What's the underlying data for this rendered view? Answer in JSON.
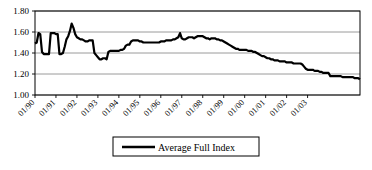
{
  "chart_data": {
    "type": "line",
    "title": "",
    "xlabel": "",
    "ylabel": "",
    "ylim": [
      1.0,
      1.8
    ],
    "ytick_values": [
      1.0,
      1.2,
      1.4,
      1.6,
      1.8
    ],
    "ytick_labels": [
      "1.00",
      "1.20",
      "1.40",
      "1.60",
      "1.80"
    ],
    "grid": true,
    "grid_axis": "y",
    "legend_position": "bottom",
    "xtick_labels": [
      "01/90",
      "01/91",
      "01/92",
      "01/93",
      "01/94",
      "01/95",
      "01/96",
      "01/97",
      "01/98",
      "01/99",
      "01/00",
      "01/01",
      "01/02",
      "01/03"
    ],
    "xtick_rotation": 45,
    "x_start": "01/90",
    "x_end": "07/03",
    "x_interval": "monthly",
    "series": [
      {
        "name": "Average Full Index",
        "color": "#000000",
        "line_width": 2.2,
        "values": [
          1.49,
          1.5,
          1.59,
          1.58,
          1.41,
          1.39,
          1.39,
          1.39,
          1.39,
          1.59,
          1.59,
          1.59,
          1.58,
          1.58,
          1.39,
          1.39,
          1.4,
          1.46,
          1.53,
          1.56,
          1.61,
          1.68,
          1.64,
          1.58,
          1.55,
          1.54,
          1.53,
          1.53,
          1.52,
          1.51,
          1.51,
          1.52,
          1.52,
          1.52,
          1.4,
          1.38,
          1.36,
          1.34,
          1.34,
          1.35,
          1.35,
          1.34,
          1.41,
          1.42,
          1.42,
          1.42,
          1.42,
          1.42,
          1.42,
          1.43,
          1.43,
          1.44,
          1.47,
          1.48,
          1.48,
          1.51,
          1.52,
          1.52,
          1.52,
          1.52,
          1.51,
          1.51,
          1.5,
          1.5,
          1.5,
          1.5,
          1.5,
          1.5,
          1.5,
          1.5,
          1.5,
          1.5,
          1.51,
          1.51,
          1.51,
          1.52,
          1.52,
          1.52,
          1.52,
          1.53,
          1.53,
          1.54,
          1.55,
          1.59,
          1.54,
          1.53,
          1.53,
          1.54,
          1.55,
          1.55,
          1.55,
          1.54,
          1.55,
          1.56,
          1.56,
          1.56,
          1.56,
          1.55,
          1.54,
          1.54,
          1.53,
          1.54,
          1.54,
          1.54,
          1.53,
          1.53,
          1.52,
          1.52,
          1.51,
          1.5,
          1.49,
          1.48,
          1.47,
          1.46,
          1.45,
          1.44,
          1.44,
          1.43,
          1.43,
          1.43,
          1.43,
          1.43,
          1.42,
          1.42,
          1.42,
          1.41,
          1.41,
          1.4,
          1.39,
          1.38,
          1.37,
          1.37,
          1.36,
          1.35,
          1.35,
          1.34,
          1.34,
          1.33,
          1.33,
          1.33,
          1.32,
          1.32,
          1.32,
          1.32,
          1.31,
          1.31,
          1.31,
          1.31,
          1.3,
          1.3,
          1.3,
          1.3,
          1.3,
          1.29,
          1.27,
          1.25,
          1.24,
          1.24,
          1.24,
          1.24,
          1.23,
          1.23,
          1.23,
          1.22,
          1.22,
          1.21,
          1.21,
          1.21,
          1.21,
          1.18,
          1.18,
          1.18,
          1.18,
          1.18,
          1.18,
          1.18,
          1.17,
          1.17,
          1.17,
          1.17,
          1.17,
          1.17,
          1.17,
          1.16,
          1.16,
          1.16,
          1.15
        ]
      }
    ]
  },
  "legend": {
    "entries": [
      {
        "label": "Average Full Index",
        "color": "#000000"
      }
    ]
  }
}
